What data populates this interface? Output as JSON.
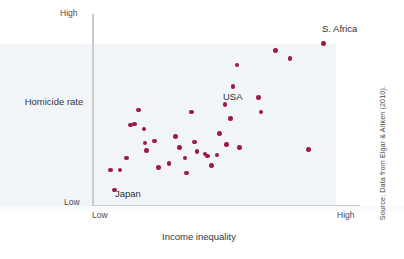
{
  "figure": {
    "accent_color": "#9b1b45",
    "axis_color": "#c9cbd0",
    "background_color": "#ffffff",
    "tint_color": "#eef1f6",
    "source_note": "Source: Data from Elgar & Aitken (2010)."
  },
  "chart_data": {
    "type": "scatter",
    "title": "",
    "xlabel": "Income inequality",
    "ylabel": "Homicide rate",
    "xtick_labels": [
      "Low",
      "High"
    ],
    "ytick_labels": [
      "Low",
      "High"
    ],
    "xlim": [
      0,
      1
    ],
    "ylim": [
      0,
      1
    ],
    "grid": false,
    "legend": "none",
    "annotations": [
      {
        "label": "Japan",
        "x": 0.09,
        "y": 0.06
      },
      {
        "label": "USA",
        "x": 0.5,
        "y": 0.53
      },
      {
        "label": "S. Africa",
        "x": 0.87,
        "y": 0.94
      }
    ],
    "points": [
      {
        "x": 0.085,
        "y": 0.075
      },
      {
        "x": 0.07,
        "y": 0.18
      },
      {
        "x": 0.105,
        "y": 0.18
      },
      {
        "x": 0.13,
        "y": 0.245
      },
      {
        "x": 0.145,
        "y": 0.42
      },
      {
        "x": 0.16,
        "y": 0.425
      },
      {
        "x": 0.175,
        "y": 0.5
      },
      {
        "x": 0.195,
        "y": 0.4
      },
      {
        "x": 0.2,
        "y": 0.325
      },
      {
        "x": 0.205,
        "y": 0.285
      },
      {
        "x": 0.235,
        "y": 0.335
      },
      {
        "x": 0.25,
        "y": 0.195
      },
      {
        "x": 0.29,
        "y": 0.215
      },
      {
        "x": 0.315,
        "y": 0.36
      },
      {
        "x": 0.33,
        "y": 0.3
      },
      {
        "x": 0.35,
        "y": 0.245
      },
      {
        "x": 0.355,
        "y": 0.165
      },
      {
        "x": 0.375,
        "y": 0.49
      },
      {
        "x": 0.385,
        "y": 0.33
      },
      {
        "x": 0.395,
        "y": 0.28
      },
      {
        "x": 0.425,
        "y": 0.265
      },
      {
        "x": 0.435,
        "y": 0.255
      },
      {
        "x": 0.45,
        "y": 0.205
      },
      {
        "x": 0.47,
        "y": 0.26
      },
      {
        "x": 0.48,
        "y": 0.375
      },
      {
        "x": 0.5,
        "y": 0.53
      },
      {
        "x": 0.505,
        "y": 0.315
      },
      {
        "x": 0.52,
        "y": 0.455
      },
      {
        "x": 0.53,
        "y": 0.625
      },
      {
        "x": 0.545,
        "y": 0.74
      },
      {
        "x": 0.555,
        "y": 0.3
      },
      {
        "x": 0.625,
        "y": 0.565
      },
      {
        "x": 0.635,
        "y": 0.49
      },
      {
        "x": 0.69,
        "y": 0.815
      },
      {
        "x": 0.745,
        "y": 0.775
      },
      {
        "x": 0.815,
        "y": 0.29
      },
      {
        "x": 0.87,
        "y": 0.855
      }
    ]
  }
}
